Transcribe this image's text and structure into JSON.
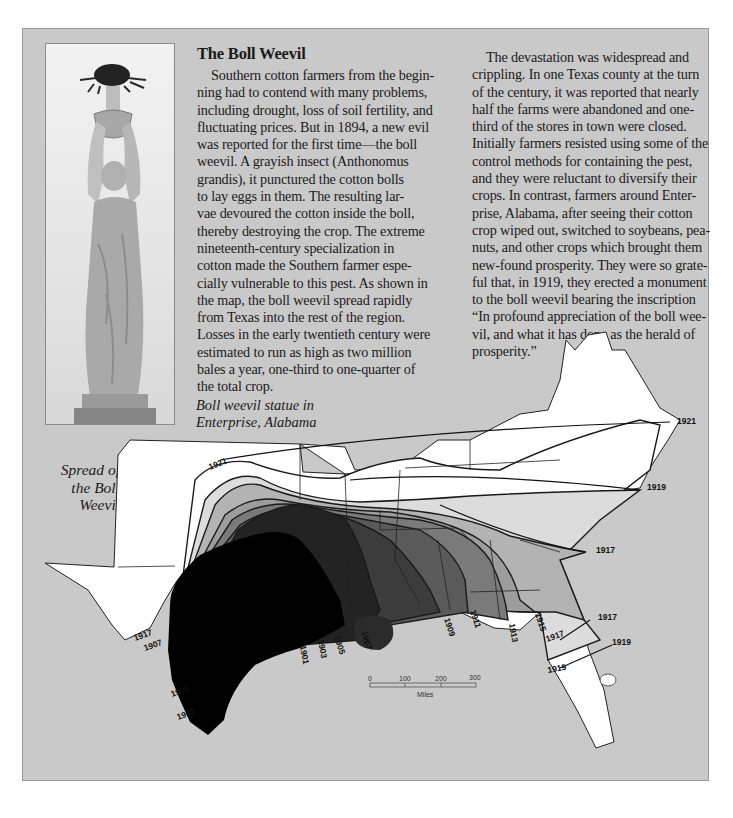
{
  "sidebar_box": {
    "title": "The Boll Weevil",
    "column1_lines": [
      "Southern cotton farmers from the begin-",
      "ning had to contend with many problems,",
      "including drought, loss of soil fertility, and",
      "fluctuating prices. But in 1894, a new evil",
      "was reported for the first time—the boll",
      "weevil. A grayish insect (Anthonomus",
      "grandis), it punctured the cotton bolls",
      "to lay eggs in them. The resulting lar-",
      "vae devoured the cotton inside the boll,",
      "thereby destroying the crop. The extreme",
      "nineteenth-century specialization in",
      "cotton made the Southern farmer espe-",
      "cially vulnerable to this pest. As shown in",
      "the map, the boll weevil spread rapidly",
      "from Texas into the rest of the region.",
      "Losses in the early twentieth century were",
      "estimated to run as high as two million",
      "bales a year, one-third to one-quarter of",
      "the total crop."
    ],
    "column2_lines": [
      "The devastation was widespread and",
      "crippling. In one Texas county at the turn",
      "of the century, it was reported that nearly",
      "half the farms were abandoned and one-",
      "third of the stores in town were closed.",
      "Initially farmers resisted using some of the",
      "control methods for containing the pest,",
      "and they were reluctant to diversify their",
      "crops. In contrast, farmers around Enter-",
      "prise, Alabama, after seeing their cotton",
      "crop wiped out, switched to soybeans, pea-",
      "nuts, and other crops which brought them",
      "new-found prosperity. They were so grate-",
      "ful that, in 1919, they erected a monument",
      "to the boll weevil bearing the inscription",
      "“In profound appreciation of the boll wee-",
      "vil, and what it has done as the herald of",
      "prosperity.”"
    ],
    "photo": {
      "description": "Boll weevil statue photograph",
      "caption_line1": "Boll weevil statue in",
      "caption_line2": "Enterprise, Alabama"
    }
  },
  "map": {
    "title_lines": [
      "Spread of",
      "the Boll",
      "Weevil"
    ],
    "year_labels": [
      {
        "text": "1921",
        "x": 210,
        "y": 470,
        "rot": -22
      },
      {
        "text": "1921",
        "x": 677,
        "y": 424,
        "rot": 0
      },
      {
        "text": "1919",
        "x": 647,
        "y": 490,
        "rot": 0
      },
      {
        "text": "1917",
        "x": 596,
        "y": 553,
        "rot": 0
      },
      {
        "text": "1917",
        "x": 598,
        "y": 620,
        "rot": 0
      },
      {
        "text": "1919",
        "x": 612,
        "y": 645,
        "rot": 0
      },
      {
        "text": "1917",
        "x": 547,
        "y": 642,
        "rot": -20
      },
      {
        "text": "1919",
        "x": 548,
        "y": 673,
        "rot": -10
      },
      {
        "text": "1915",
        "x": 535,
        "y": 614,
        "rot": 72
      },
      {
        "text": "1913",
        "x": 509,
        "y": 624,
        "rot": 80
      },
      {
        "text": "1911",
        "x": 470,
        "y": 611,
        "rot": 72
      },
      {
        "text": "1909",
        "x": 444,
        "y": 619,
        "rot": 72
      },
      {
        "text": "1907",
        "x": 361,
        "y": 632,
        "rot": 72
      },
      {
        "text": "1905",
        "x": 334,
        "y": 637,
        "rot": 72
      },
      {
        "text": "1903",
        "x": 318,
        "y": 640,
        "rot": 80
      },
      {
        "text": "1901",
        "x": 300,
        "y": 646,
        "rot": 80
      },
      {
        "text": "1917",
        "x": 135,
        "y": 641,
        "rot": -20
      },
      {
        "text": "1907",
        "x": 145,
        "y": 651,
        "rot": -20
      },
      {
        "text": "1905",
        "x": 172,
        "y": 697,
        "rot": -20
      },
      {
        "text": "1901",
        "x": 178,
        "y": 720,
        "rot": -20
      }
    ],
    "scale_bar": {
      "ticks": [
        "0",
        "100",
        "200",
        "300"
      ],
      "unit": "Miles"
    },
    "legend_shades": [
      "#000000",
      "#232323",
      "#3c3c3c",
      "#5a5a5a",
      "#7a7a7a",
      "#9d9d9d",
      "#b3b3b3",
      "#dcdcdc",
      "#ffffff"
    ]
  }
}
